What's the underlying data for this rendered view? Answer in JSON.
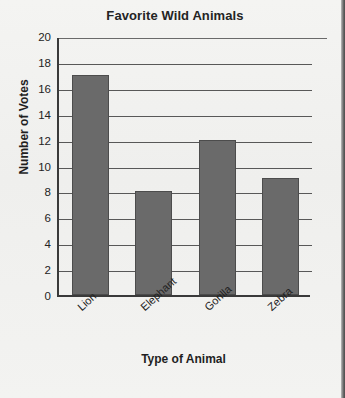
{
  "chart_data": {
    "type": "bar",
    "title": "Favorite Wild Animals",
    "xlabel": "Type of Animal",
    "ylabel": "Number of Votes",
    "categories": [
      "Lion",
      "Elephant",
      "Gorilla",
      "Zebra"
    ],
    "values": [
      17,
      8,
      12,
      9
    ],
    "ylim": [
      0,
      20
    ],
    "ytick_step": 2,
    "yticks": [
      "20",
      "18",
      "16",
      "14",
      "12",
      "10",
      "8",
      "6",
      "4",
      "2",
      "0"
    ],
    "grid": true,
    "legend": false,
    "bar_color": "#6a6a6a",
    "axis_color": "#3a3a3a",
    "background_color": "#f2f2f0"
  }
}
